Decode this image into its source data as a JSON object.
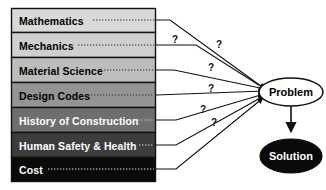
{
  "diagram": {
    "type": "convergence-diagram",
    "disciplines": [
      {
        "label": "Mathematics",
        "fill": "#d9d9d9",
        "text_color": "#000000",
        "connector": "dotted"
      },
      {
        "label": "Mechanics",
        "fill": "#cfcfcf",
        "text_color": "#000000",
        "connector": "dotted"
      },
      {
        "label": "Material Science",
        "fill": "#bdbdbd",
        "text_color": "#000000",
        "connector": "dotted"
      },
      {
        "label": "Design Codes",
        "fill": "#949494",
        "text_color": "#000000",
        "connector": "dotted"
      },
      {
        "label": "History of Construction",
        "fill": "#6e6e6e",
        "text_color": "#ffffff",
        "connector": "dotted"
      },
      {
        "label": "Human Safety & Health",
        "fill": "#3d3d3d",
        "text_color": "#ffffff",
        "connector": "dotted"
      },
      {
        "label": "Cost",
        "fill": "#0a0a0a",
        "text_color": "#ffffff",
        "connector": "dotted"
      }
    ],
    "question_marks": [
      {
        "id": "q1",
        "text": "?",
        "x": 172,
        "y": 43
      },
      {
        "id": "q2",
        "text": "?",
        "x": 216,
        "y": 48
      },
      {
        "id": "q3",
        "text": "?",
        "x": 208,
        "y": 71
      },
      {
        "id": "q4",
        "text": "?",
        "x": 208,
        "y": 92
      },
      {
        "id": "q5",
        "text": "?",
        "x": 200,
        "y": 113
      },
      {
        "id": "q6",
        "text": "?",
        "x": 211,
        "y": 126
      }
    ],
    "nodes": {
      "problem": {
        "label": "Problem",
        "fill": "#ffffff",
        "stroke": "#000000",
        "text_color": "#000000"
      },
      "solution": {
        "label": "Solution",
        "fill": "#0a0a0a",
        "stroke": "#000000",
        "text_color": "#ffffff"
      }
    },
    "colors": {
      "background": "#ffffff",
      "outline": "#000000",
      "arrow": "#1a1a1a"
    }
  }
}
